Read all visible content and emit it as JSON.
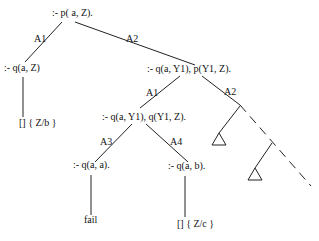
{
  "diagram": {
    "type": "sld-resolution-tree",
    "nodes": {
      "root": ":- p( a, Z).",
      "left": ":- q(a, Z)",
      "left_leaf": "[] { Z/b }",
      "right": ":- q(a, Y1), p(Y1, Z).",
      "mid": ":- q(a, Y1), q(Y1, Z).",
      "mid_left": ":- q(a, a).",
      "mid_left_leaf": "fail",
      "mid_right": ":- q(a, b).",
      "mid_right_leaf": "[] { Z/c }"
    },
    "edges": {
      "root_left": "A1",
      "root_right": "A2",
      "right_mid": "A1",
      "right_cont": "A2",
      "mid_left": "A3",
      "mid_right": "A4"
    },
    "colors": {
      "line": "#222222",
      "text": "#111111",
      "background": "#ffffff"
    }
  }
}
